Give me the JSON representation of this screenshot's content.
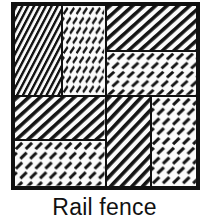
{
  "figure": {
    "caption": "Rail fence",
    "block_name": "Rail fence",
    "colors": {
      "ink": "#111111",
      "fabric_background": "#fbfbfb",
      "page_background": "#ffffff"
    },
    "block": {
      "border_label": "block-outline",
      "rows": 2,
      "columns": 2,
      "patches_per_quadrant": 2,
      "quadrants": [
        {
          "position": "top-left",
          "split": "vertical",
          "patches": [
            {
              "label": "diagonal-hatch-patch",
              "fabric": "diagonal-hatch",
              "orientation": "vertical-strip"
            },
            {
              "label": "dashed-texture-patch",
              "fabric": "dashed-texture",
              "orientation": "vertical-strip"
            }
          ]
        },
        {
          "position": "top-right",
          "split": "horizontal",
          "patches": [
            {
              "label": "diagonal-hatch-patch",
              "fabric": "diagonal-hatch",
              "orientation": "horizontal-strip"
            },
            {
              "label": "dashed-texture-patch",
              "fabric": "dashed-texture",
              "orientation": "horizontal-strip"
            }
          ]
        },
        {
          "position": "bottom-left",
          "split": "horizontal",
          "patches": [
            {
              "label": "diagonal-hatch-patch",
              "fabric": "diagonal-hatch",
              "orientation": "horizontal-strip"
            },
            {
              "label": "dashed-texture-patch",
              "fabric": "dashed-texture",
              "orientation": "horizontal-strip"
            }
          ]
        },
        {
          "position": "bottom-right",
          "split": "vertical",
          "patches": [
            {
              "label": "diagonal-hatch-patch",
              "fabric": "diagonal-hatch",
              "orientation": "vertical-strip"
            },
            {
              "label": "dashed-texture-patch",
              "fabric": "dashed-texture",
              "orientation": "vertical-strip"
            }
          ]
        }
      ]
    }
  }
}
